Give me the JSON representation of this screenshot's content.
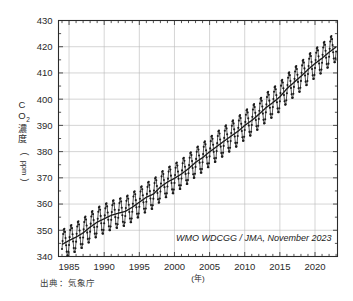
{
  "figure": {
    "source_note": "出典：気象庁",
    "annotation": "WMO WDCGG / JMA, November 2023"
  },
  "chart_data": {
    "type": "line",
    "title": "",
    "subtitle": "",
    "xlabel": "(年)",
    "ylabel": "ＣＯ２濃度（ppm）",
    "ylabel_parts": [
      "C",
      "O",
      "2",
      "濃",
      "度",
      "(",
      "ppm",
      ")"
    ],
    "annotation": "WMO WDCGG / JMA, November 2023",
    "xlim": [
      1983.5,
      2023.2
    ],
    "ylim": [
      340,
      430
    ],
    "ytick_labels": [
      "340",
      "350",
      "360",
      "370",
      "380",
      "390",
      "400",
      "410",
      "420",
      "430"
    ],
    "yticks": [
      340,
      350,
      360,
      370,
      380,
      390,
      400,
      410,
      420,
      430
    ],
    "xtick_labels": [
      "1985",
      "1990",
      "1995",
      "2000",
      "2005",
      "2010",
      "2015",
      "2020"
    ],
    "xticks": [
      1985,
      1990,
      1995,
      2000,
      2005,
      2010,
      2015,
      2020
    ],
    "x_minor_step": 1,
    "grid": true,
    "grid_color": "#b9b9b9",
    "legend": "none",
    "line_color": "#1a1a1a",
    "marker": "filled-circle",
    "series": [
      {
        "name": "月平均濃度",
        "description": "Monthly mean global CO2 concentration with seasonal cycle",
        "seasonal_amplitude_ppm": 5.6,
        "values": [
          {
            "x": 1984.0,
            "y": 344.2
          },
          {
            "x": 1984.5,
            "y": 341.1
          },
          {
            "x": 1985.0,
            "y": 345.6
          },
          {
            "x": 1985.5,
            "y": 342.3
          },
          {
            "x": 1986.0,
            "y": 347.0
          },
          {
            "x": 1986.5,
            "y": 343.6
          },
          {
            "x": 1987.0,
            "y": 348.4
          },
          {
            "x": 1987.5,
            "y": 345.3
          },
          {
            "x": 1988.0,
            "y": 350.7
          },
          {
            "x": 1988.5,
            "y": 347.5
          },
          {
            "x": 1989.0,
            "y": 352.5
          },
          {
            "x": 1989.5,
            "y": 349.1
          },
          {
            "x": 1990.0,
            "y": 353.8
          },
          {
            "x": 1990.5,
            "y": 350.3
          },
          {
            "x": 1991.0,
            "y": 355.0
          },
          {
            "x": 1991.5,
            "y": 351.4
          },
          {
            "x": 1992.0,
            "y": 355.9
          },
          {
            "x": 1992.5,
            "y": 352.2
          },
          {
            "x": 1993.0,
            "y": 356.6
          },
          {
            "x": 1993.5,
            "y": 353.1
          },
          {
            "x": 1994.0,
            "y": 358.2
          },
          {
            "x": 1994.5,
            "y": 354.7
          },
          {
            "x": 1995.0,
            "y": 360.1
          },
          {
            "x": 1995.5,
            "y": 356.5
          },
          {
            "x": 1996.0,
            "y": 362.1
          },
          {
            "x": 1996.5,
            "y": 358.4
          },
          {
            "x": 1997.0,
            "y": 363.2
          },
          {
            "x": 1997.5,
            "y": 359.8
          },
          {
            "x": 1998.0,
            "y": 365.9
          },
          {
            "x": 1998.5,
            "y": 362.4
          },
          {
            "x": 1999.0,
            "y": 368.1
          },
          {
            "x": 1999.5,
            "y": 364.5
          },
          {
            "x": 2000.0,
            "y": 369.4
          },
          {
            "x": 2000.5,
            "y": 365.8
          },
          {
            "x": 2001.0,
            "y": 371.0
          },
          {
            "x": 2001.5,
            "y": 367.4
          },
          {
            "x": 2002.0,
            "y": 373.1
          },
          {
            "x": 2002.5,
            "y": 369.4
          },
          {
            "x": 2003.0,
            "y": 375.5
          },
          {
            "x": 2003.5,
            "y": 371.8
          },
          {
            "x": 2004.0,
            "y": 377.3
          },
          {
            "x": 2004.5,
            "y": 373.6
          },
          {
            "x": 2005.0,
            "y": 379.5
          },
          {
            "x": 2005.5,
            "y": 375.8
          },
          {
            "x": 2006.0,
            "y": 381.5
          },
          {
            "x": 2006.5,
            "y": 377.8
          },
          {
            "x": 2007.0,
            "y": 383.6
          },
          {
            "x": 2007.5,
            "y": 379.9
          },
          {
            "x": 2008.0,
            "y": 385.4
          },
          {
            "x": 2008.5,
            "y": 381.7
          },
          {
            "x": 2009.0,
            "y": 387.3
          },
          {
            "x": 2009.5,
            "y": 383.6
          },
          {
            "x": 2010.0,
            "y": 389.6
          },
          {
            "x": 2010.5,
            "y": 385.9
          },
          {
            "x": 2011.0,
            "y": 391.5
          },
          {
            "x": 2011.5,
            "y": 387.8
          },
          {
            "x": 2012.0,
            "y": 393.8
          },
          {
            "x": 2012.5,
            "y": 390.0
          },
          {
            "x": 2013.0,
            "y": 396.3
          },
          {
            "x": 2013.5,
            "y": 392.5
          },
          {
            "x": 2014.0,
            "y": 398.3
          },
          {
            "x": 2014.5,
            "y": 394.5
          },
          {
            "x": 2015.0,
            "y": 400.5
          },
          {
            "x": 2015.5,
            "y": 396.7
          },
          {
            "x": 2016.0,
            "y": 403.6
          },
          {
            "x": 2016.5,
            "y": 399.8
          },
          {
            "x": 2017.0,
            "y": 406.0
          },
          {
            "x": 2017.5,
            "y": 402.2
          },
          {
            "x": 2018.0,
            "y": 408.3
          },
          {
            "x": 2018.5,
            "y": 404.5
          },
          {
            "x": 2019.0,
            "y": 410.9
          },
          {
            "x": 2019.5,
            "y": 407.1
          },
          {
            "x": 2020.0,
            "y": 413.2
          },
          {
            "x": 2020.5,
            "y": 409.4
          },
          {
            "x": 2021.0,
            "y": 415.2
          },
          {
            "x": 2021.5,
            "y": 411.4
          },
          {
            "x": 2022.0,
            "y": 417.5
          },
          {
            "x": 2022.5,
            "y": 413.7
          },
          {
            "x": 2023.0,
            "y": 419.6
          }
        ]
      },
      {
        "name": "季節変動を除いた濃度",
        "description": "Seasonally adjusted trend line",
        "trend": [
          {
            "x": 1984.0,
            "y": 344.6
          },
          {
            "x": 1985.0,
            "y": 346.1
          },
          {
            "x": 1986.0,
            "y": 347.4
          },
          {
            "x": 1987.0,
            "y": 349.0
          },
          {
            "x": 1988.0,
            "y": 351.2
          },
          {
            "x": 1989.0,
            "y": 353.1
          },
          {
            "x": 1990.0,
            "y": 354.4
          },
          {
            "x": 1991.0,
            "y": 355.7
          },
          {
            "x": 1992.0,
            "y": 356.5
          },
          {
            "x": 1993.0,
            "y": 357.2
          },
          {
            "x": 1994.0,
            "y": 358.8
          },
          {
            "x": 1995.0,
            "y": 360.7
          },
          {
            "x": 1996.0,
            "y": 362.6
          },
          {
            "x": 1997.0,
            "y": 363.8
          },
          {
            "x": 1998.0,
            "y": 366.5
          },
          {
            "x": 1999.0,
            "y": 368.4
          },
          {
            "x": 2000.0,
            "y": 369.8
          },
          {
            "x": 2001.0,
            "y": 371.5
          },
          {
            "x": 2002.0,
            "y": 373.5
          },
          {
            "x": 2003.0,
            "y": 375.9
          },
          {
            "x": 2004.0,
            "y": 377.7
          },
          {
            "x": 2005.0,
            "y": 379.9
          },
          {
            "x": 2006.0,
            "y": 381.9
          },
          {
            "x": 2007.0,
            "y": 383.9
          },
          {
            "x": 2008.0,
            "y": 385.8
          },
          {
            "x": 2009.0,
            "y": 387.7
          },
          {
            "x": 2010.0,
            "y": 390.0
          },
          {
            "x": 2011.0,
            "y": 391.9
          },
          {
            "x": 2012.0,
            "y": 394.2
          },
          {
            "x": 2013.0,
            "y": 396.7
          },
          {
            "x": 2014.0,
            "y": 398.7
          },
          {
            "x": 2015.0,
            "y": 400.9
          },
          {
            "x": 2016.0,
            "y": 404.0
          },
          {
            "x": 2017.0,
            "y": 406.4
          },
          {
            "x": 2018.0,
            "y": 408.7
          },
          {
            "x": 2019.0,
            "y": 411.3
          },
          {
            "x": 2020.0,
            "y": 413.6
          },
          {
            "x": 2021.0,
            "y": 415.6
          },
          {
            "x": 2022.0,
            "y": 417.9
          },
          {
            "x": 2023.0,
            "y": 419.9
          }
        ]
      }
    ]
  }
}
